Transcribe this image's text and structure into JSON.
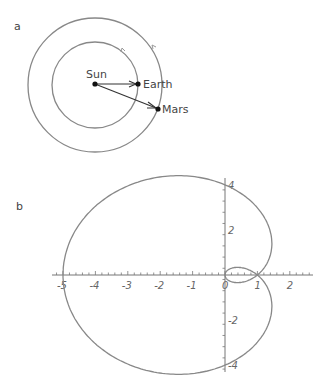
{
  "panel_a": {
    "label": "a",
    "sun_label": "Sun",
    "earth_label": "Earth",
    "mars_label": "Mars"
  },
  "panel_b": {
    "label": "b"
  },
  "chart_data": {
    "type": "line",
    "xlabel": "",
    "ylabel": "",
    "xlim": [
      -5.3,
      2.7
    ],
    "ylim": [
      -4.5,
      4.5
    ],
    "x_ticks": [
      "-5",
      "-4",
      "-3",
      "-2",
      "-1",
      "0",
      "1",
      "2"
    ],
    "y_ticks": [
      "4",
      "2",
      "-2",
      "-4"
    ],
    "curve": "limacon shifted: x = 1 + r cos(t), y = r sin(t) * 1.2, r = 2.5 - 3.5 cos(t)",
    "key_points": {
      "left_intercept": [
        -5,
        0
      ],
      "inner_loop": [
        [
          1,
          0
        ],
        [
          2,
          0
        ]
      ],
      "top": [
        -0.4,
        4.2
      ],
      "bottom": [
        -0.4,
        -4.2
      ],
      "right_max_x": 2.5
    },
    "grid": false,
    "legend": null
  }
}
